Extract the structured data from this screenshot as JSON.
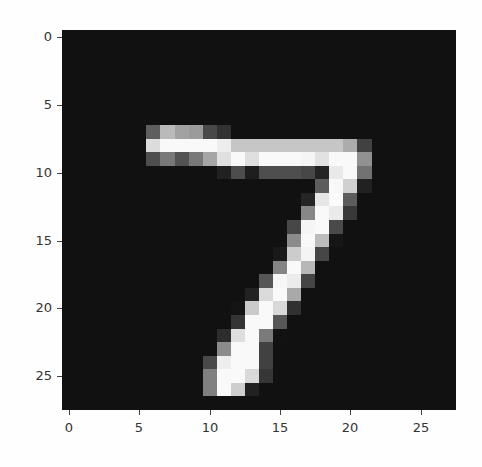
{
  "chart_data": {
    "type": "heatmap",
    "title": "",
    "xlabel": "",
    "ylabel": "",
    "colormap": "gray",
    "shape": [
      28,
      28
    ],
    "xlim": [
      -0.5,
      27.5
    ],
    "ylim": [
      27.5,
      -0.5
    ],
    "grid": false,
    "x_ticks": [
      0,
      5,
      10,
      15,
      20,
      25
    ],
    "y_ticks": [
      0,
      5,
      10,
      15,
      20,
      25
    ],
    "x_tick_labels": [
      "0",
      "5",
      "10",
      "15",
      "20",
      "25"
    ],
    "y_tick_labels": [
      "0",
      "5",
      "10",
      "15",
      "20",
      "25"
    ],
    "depicts": "handwritten digit 7",
    "values": [
      [
        0,
        0,
        0,
        0,
        0,
        0,
        0,
        0,
        0,
        0,
        0,
        0,
        0,
        0,
        0,
        0,
        0,
        0,
        0,
        0,
        0,
        0,
        0,
        0,
        0,
        0,
        0,
        0
      ],
      [
        0,
        0,
        0,
        0,
        0,
        0,
        0,
        0,
        0,
        0,
        0,
        0,
        0,
        0,
        0,
        0,
        0,
        0,
        0,
        0,
        0,
        0,
        0,
        0,
        0,
        0,
        0,
        0
      ],
      [
        0,
        0,
        0,
        0,
        0,
        0,
        0,
        0,
        0,
        0,
        0,
        0,
        0,
        0,
        0,
        0,
        0,
        0,
        0,
        0,
        0,
        0,
        0,
        0,
        0,
        0,
        0,
        0
      ],
      [
        0,
        0,
        0,
        0,
        0,
        0,
        0,
        0,
        0,
        0,
        0,
        0,
        0,
        0,
        0,
        0,
        0,
        0,
        0,
        0,
        0,
        0,
        0,
        0,
        0,
        0,
        0,
        0
      ],
      [
        0,
        0,
        0,
        0,
        0,
        0,
        0,
        0,
        0,
        0,
        0,
        0,
        0,
        0,
        0,
        0,
        0,
        0,
        0,
        0,
        0,
        0,
        0,
        0,
        0,
        0,
        0,
        0
      ],
      [
        0,
        0,
        0,
        0,
        0,
        0,
        0,
        0,
        0,
        0,
        0,
        0,
        0,
        0,
        0,
        0,
        0,
        0,
        0,
        0,
        0,
        0,
        0,
        0,
        0,
        0,
        0,
        0
      ],
      [
        0,
        0,
        0,
        0,
        0,
        0,
        0,
        0,
        0,
        0,
        0,
        0,
        0,
        0,
        0,
        0,
        0,
        0,
        0,
        0,
        0,
        0,
        0,
        0,
        0,
        0,
        0,
        0
      ],
      [
        0,
        0,
        0,
        0,
        0,
        0,
        84,
        185,
        159,
        151,
        60,
        36,
        0,
        0,
        0,
        0,
        0,
        0,
        0,
        0,
        0,
        0,
        0,
        0,
        0,
        0,
        0,
        0
      ],
      [
        0,
        0,
        0,
        0,
        0,
        0,
        222,
        254,
        254,
        254,
        254,
        241,
        198,
        198,
        198,
        198,
        198,
        198,
        198,
        198,
        170,
        52,
        0,
        0,
        0,
        0,
        0,
        0
      ],
      [
        0,
        0,
        0,
        0,
        0,
        0,
        67,
        114,
        72,
        114,
        163,
        227,
        254,
        225,
        254,
        254,
        254,
        250,
        229,
        254,
        254,
        140,
        0,
        0,
        0,
        0,
        0,
        0
      ],
      [
        0,
        0,
        0,
        0,
        0,
        0,
        0,
        0,
        0,
        0,
        0,
        17,
        66,
        14,
        67,
        67,
        67,
        59,
        21,
        236,
        254,
        106,
        0,
        0,
        0,
        0,
        0,
        0
      ],
      [
        0,
        0,
        0,
        0,
        0,
        0,
        0,
        0,
        0,
        0,
        0,
        0,
        0,
        0,
        0,
        0,
        0,
        0,
        83,
        253,
        209,
        18,
        0,
        0,
        0,
        0,
        0,
        0
      ],
      [
        0,
        0,
        0,
        0,
        0,
        0,
        0,
        0,
        0,
        0,
        0,
        0,
        0,
        0,
        0,
        0,
        0,
        22,
        233,
        255,
        83,
        0,
        0,
        0,
        0,
        0,
        0,
        0
      ],
      [
        0,
        0,
        0,
        0,
        0,
        0,
        0,
        0,
        0,
        0,
        0,
        0,
        0,
        0,
        0,
        0,
        0,
        129,
        254,
        238,
        44,
        0,
        0,
        0,
        0,
        0,
        0,
        0
      ],
      [
        0,
        0,
        0,
        0,
        0,
        0,
        0,
        0,
        0,
        0,
        0,
        0,
        0,
        0,
        0,
        0,
        59,
        249,
        254,
        62,
        0,
        0,
        0,
        0,
        0,
        0,
        0,
        0
      ],
      [
        0,
        0,
        0,
        0,
        0,
        0,
        0,
        0,
        0,
        0,
        0,
        0,
        0,
        0,
        0,
        0,
        133,
        254,
        187,
        5,
        0,
        0,
        0,
        0,
        0,
        0,
        0,
        0
      ],
      [
        0,
        0,
        0,
        0,
        0,
        0,
        0,
        0,
        0,
        0,
        0,
        0,
        0,
        0,
        0,
        9,
        205,
        248,
        58,
        0,
        0,
        0,
        0,
        0,
        0,
        0,
        0,
        0
      ],
      [
        0,
        0,
        0,
        0,
        0,
        0,
        0,
        0,
        0,
        0,
        0,
        0,
        0,
        0,
        0,
        126,
        254,
        182,
        0,
        0,
        0,
        0,
        0,
        0,
        0,
        0,
        0,
        0
      ],
      [
        0,
        0,
        0,
        0,
        0,
        0,
        0,
        0,
        0,
        0,
        0,
        0,
        0,
        0,
        75,
        251,
        240,
        57,
        0,
        0,
        0,
        0,
        0,
        0,
        0,
        0,
        0,
        0
      ],
      [
        0,
        0,
        0,
        0,
        0,
        0,
        0,
        0,
        0,
        0,
        0,
        0,
        0,
        19,
        221,
        254,
        166,
        0,
        0,
        0,
        0,
        0,
        0,
        0,
        0,
        0,
        0,
        0
      ],
      [
        0,
        0,
        0,
        0,
        0,
        0,
        0,
        0,
        0,
        0,
        0,
        0,
        3,
        203,
        254,
        219,
        35,
        0,
        0,
        0,
        0,
        0,
        0,
        0,
        0,
        0,
        0,
        0
      ],
      [
        0,
        0,
        0,
        0,
        0,
        0,
        0,
        0,
        0,
        0,
        0,
        0,
        38,
        254,
        254,
        77,
        0,
        0,
        0,
        0,
        0,
        0,
        0,
        0,
        0,
        0,
        0,
        0
      ],
      [
        0,
        0,
        0,
        0,
        0,
        0,
        0,
        0,
        0,
        0,
        0,
        31,
        224,
        254,
        115,
        1,
        0,
        0,
        0,
        0,
        0,
        0,
        0,
        0,
        0,
        0,
        0,
        0
      ],
      [
        0,
        0,
        0,
        0,
        0,
        0,
        0,
        0,
        0,
        0,
        0,
        133,
        254,
        254,
        52,
        0,
        0,
        0,
        0,
        0,
        0,
        0,
        0,
        0,
        0,
        0,
        0,
        0
      ],
      [
        0,
        0,
        0,
        0,
        0,
        0,
        0,
        0,
        0,
        0,
        61,
        242,
        254,
        254,
        52,
        0,
        0,
        0,
        0,
        0,
        0,
        0,
        0,
        0,
        0,
        0,
        0,
        0
      ],
      [
        0,
        0,
        0,
        0,
        0,
        0,
        0,
        0,
        0,
        0,
        121,
        254,
        254,
        219,
        40,
        0,
        0,
        0,
        0,
        0,
        0,
        0,
        0,
        0,
        0,
        0,
        0,
        0
      ],
      [
        0,
        0,
        0,
        0,
        0,
        0,
        0,
        0,
        0,
        0,
        121,
        254,
        207,
        18,
        0,
        0,
        0,
        0,
        0,
        0,
        0,
        0,
        0,
        0,
        0,
        0,
        0,
        0
      ],
      [
        0,
        0,
        0,
        0,
        0,
        0,
        0,
        0,
        0,
        0,
        0,
        0,
        0,
        0,
        0,
        0,
        0,
        0,
        0,
        0,
        0,
        0,
        0,
        0,
        0,
        0,
        0,
        0
      ]
    ]
  },
  "colors": {
    "background": "#fefefe",
    "image_min": "#111111",
    "image_max": "#fafafa",
    "tick_text": "#333333"
  }
}
